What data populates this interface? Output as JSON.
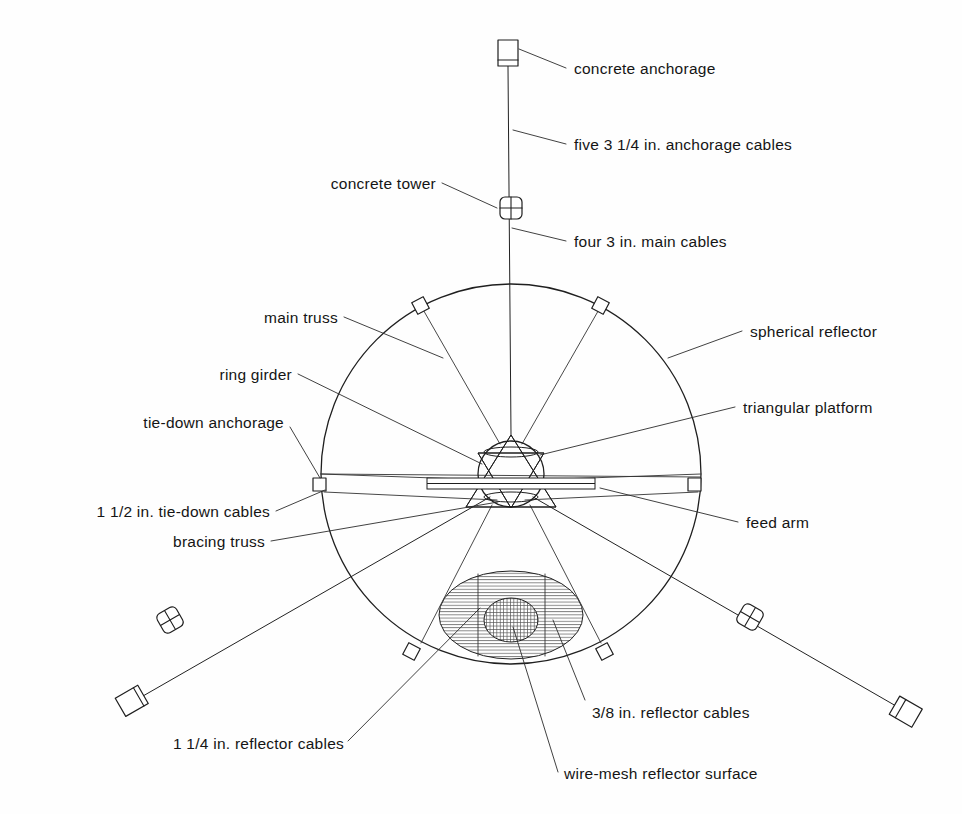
{
  "figure": {
    "kind": "engineering-diagram",
    "background_color": "#fefefe",
    "line_color": "#1f1f1f"
  },
  "labels": {
    "concrete_anchorage": "concrete anchorage",
    "anchorage_cables": "five 3 1/4 in. anchorage cables",
    "concrete_tower": "concrete tower",
    "main_cables": "four 3 in. main cables",
    "main_truss": "main truss",
    "ring_girder": "ring girder",
    "tie_down_anchorage": "tie-down anchorage",
    "tie_down_cables": "1 1/2 in. tie-down cables",
    "bracing_truss": "bracing truss",
    "spherical_reflector": "spherical reflector",
    "triangular_platform": "triangular platform",
    "feed_arm": "feed arm",
    "reflector_cables_38": "3/8 in. reflector cables",
    "reflector_cables_114": "1 1/4 in. reflector cables",
    "wire_mesh_surface": "wire-mesh reflector surface"
  },
  "geometry": {
    "reflector_circle": {
      "cx": 511,
      "cy": 474,
      "r": 190
    },
    "ring_girder": {
      "cx": 511,
      "cy": 474,
      "r": 33
    },
    "platform_apex": {
      "x": 511,
      "y": 435
    },
    "feed_arm_bar": {
      "x": 427,
      "y": 478,
      "width": 168,
      "height": 11
    },
    "dish_outer": {
      "cx": 511,
      "cy": 615,
      "rx": 72,
      "ry": 44
    },
    "dish_inner": {
      "cx": 511,
      "cy": 620,
      "rx": 27,
      "ry": 22
    },
    "rim_anchorage_angles_deg": [
      -118,
      -62,
      180,
      0,
      118,
      62
    ],
    "towers": [
      {
        "x": 511,
        "y": 208,
        "rotation": 0
      },
      {
        "x": 170,
        "y": 620,
        "rotation": -30
      },
      {
        "x": 750,
        "y": 617,
        "rotation": 30
      }
    ],
    "anchorages": [
      {
        "x": 508,
        "y": 53,
        "rotation": 0
      },
      {
        "x": 133,
        "y": 703,
        "rotation": -30
      },
      {
        "x": 905,
        "y": 713,
        "rotation": 30
      }
    ]
  }
}
